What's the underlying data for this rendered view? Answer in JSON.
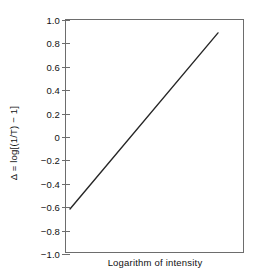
{
  "chart_data": {
    "type": "line",
    "title": "",
    "xlabel": "Logarithm of intensity",
    "ylabel": "Δ = log[(1/T) − 1]",
    "ylim": [
      -1.0,
      1.0
    ],
    "xlim": [
      0,
      1
    ],
    "grid": false,
    "legend": null,
    "yticks": [
      {
        "value": 1.0,
        "label": "1.0"
      },
      {
        "value": 0.8,
        "label": "0.8"
      },
      {
        "value": 0.6,
        "label": "0.6"
      },
      {
        "value": 0.4,
        "label": "0.4"
      },
      {
        "value": 0.2,
        "label": "0.2"
      },
      {
        "value": 0.0,
        "label": "0"
      },
      {
        "value": -0.2,
        "label": "−0.2"
      },
      {
        "value": -0.4,
        "label": "−0.4"
      },
      {
        "value": -0.6,
        "label": "−0.6"
      },
      {
        "value": -0.8,
        "label": "−0.8"
      },
      {
        "value": -1.0,
        "label": "−1.0"
      }
    ],
    "xticks": [],
    "series": [
      {
        "name": "response line",
        "type": "line",
        "color": "#262626",
        "x": [
          0.0223,
          0.8492
        ],
        "y": [
          -0.615,
          0.89
        ],
        "points": [
          {
            "x": 0.0223,
            "y": -0.615
          },
          {
            "x": 0.8492,
            "y": 0.89
          }
        ]
      }
    ],
    "axis_color": "#6d6d6d"
  },
  "figure": {
    "background": "#ffffff"
  }
}
